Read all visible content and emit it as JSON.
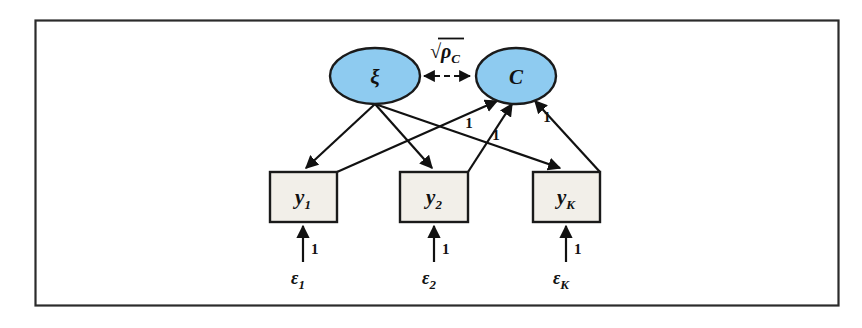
{
  "figure": {
    "type": "sem-path-diagram",
    "frame": {
      "border_color": "#2b2b2b",
      "background": "#ffffff"
    },
    "colors": {
      "latent_fill": "#8ecbf0",
      "latent_stroke": "#1a1a1a",
      "observed_fill": "#f2efe9",
      "observed_stroke": "#1a1a1a",
      "path_stroke": "#111111",
      "text": "#111111"
    }
  },
  "latent_variables": [
    {
      "id": "xi",
      "label": "ξ",
      "shape": "ellipse",
      "cx": 375,
      "cy": 76
    },
    {
      "id": "C",
      "label": "C",
      "shape": "ellipse",
      "cx": 516,
      "cy": 76
    }
  ],
  "observed_variables": [
    {
      "id": "y1",
      "label": "y",
      "subscript": "1",
      "shape": "rectangle",
      "x": 270,
      "y": 172,
      "width": 67,
      "height": 50
    },
    {
      "id": "y2",
      "label": "y",
      "subscript": "2",
      "shape": "rectangle",
      "x": 400,
      "y": 172,
      "width": 68,
      "height": 50
    },
    {
      "id": "yK",
      "label": "y",
      "subscript": "K",
      "shape": "rectangle",
      "x": 533,
      "y": 172,
      "width": 67,
      "height": 50
    }
  ],
  "error_terms": [
    {
      "id": "e1",
      "label": "ε",
      "subscript": "1",
      "x": 292,
      "y": 277
    },
    {
      "id": "e2",
      "label": "ε",
      "subscript": "2",
      "x": 423,
      "y": 277
    },
    {
      "id": "eK",
      "label": "ε",
      "subscript": "K",
      "x": 555,
      "y": 277
    }
  ],
  "correlation_path": {
    "from": "xi",
    "to": "C",
    "style": "dashed",
    "arrowheads": "both",
    "label_root": "√",
    "label_base": "ρ",
    "label_subscript": "C"
  },
  "loading_paths": [
    {
      "from": "xi",
      "to": "y1",
      "arrowhead": "to-observed",
      "label": ""
    },
    {
      "from": "xi",
      "to": "y2",
      "arrowhead": "to-observed",
      "label": ""
    },
    {
      "from": "xi",
      "to": "yK",
      "arrowhead": "to-observed",
      "label": ""
    }
  ],
  "composite_paths": [
    {
      "from": "y1",
      "to": "C",
      "arrowhead": "to-latent",
      "label": "1",
      "label_x": 469,
      "label_y": 128
    },
    {
      "from": "y2",
      "to": "C",
      "arrowhead": "to-latent",
      "label": "1",
      "label_x": 496,
      "label_y": 140
    },
    {
      "from": "yK",
      "to": "C",
      "arrowhead": "to-latent",
      "label": "1",
      "label_x": 545,
      "label_y": 122
    }
  ],
  "error_paths": [
    {
      "from": "e1",
      "to": "y1",
      "arrowhead": "to-observed",
      "label": "1",
      "label_x": 310,
      "label_y": 249
    },
    {
      "from": "e2",
      "to": "y2",
      "arrowhead": "to-observed",
      "label": "1",
      "label_x": 441,
      "label_y": 249
    },
    {
      "from": "eK",
      "to": "yK",
      "arrowhead": "to-observed",
      "label": "1",
      "label_x": 573,
      "label_y": 249
    }
  ]
}
